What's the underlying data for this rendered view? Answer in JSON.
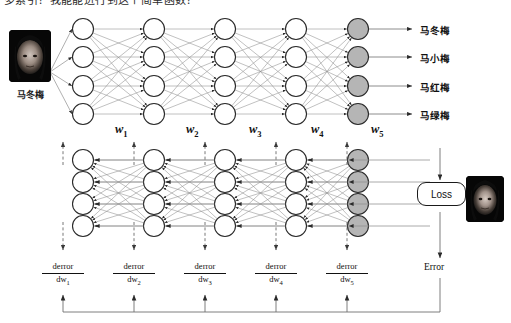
{
  "header": {
    "clipped_text": "多索引？我能能进行到这个简单函数？"
  },
  "input": {
    "caption": "马冬梅",
    "alt": "input-face-photo"
  },
  "target": {
    "alt": "target-face-photo"
  },
  "outputs": [
    {
      "label": "马冬梅"
    },
    {
      "label": "马小梅"
    },
    {
      "label": "马红梅"
    },
    {
      "label": "马绿梅"
    }
  ],
  "weights": [
    {
      "symbol": "w",
      "sub": "1"
    },
    {
      "symbol": "w",
      "sub": "2"
    },
    {
      "symbol": "w",
      "sub": "3"
    },
    {
      "symbol": "w",
      "sub": "4"
    },
    {
      "symbol": "w",
      "sub": "5"
    }
  ],
  "gradients": [
    {
      "numerator": "derror",
      "denominator": "dw",
      "sub": "1"
    },
    {
      "numerator": "derror",
      "denominator": "dw",
      "sub": "2"
    },
    {
      "numerator": "derror",
      "denominator": "dw",
      "sub": "3"
    },
    {
      "numerator": "derror",
      "denominator": "dw",
      "sub": "4"
    },
    {
      "numerator": "derror",
      "denominator": "dw",
      "sub": "5"
    }
  ],
  "loss": {
    "label": "Loss"
  },
  "error": {
    "label": "Error"
  },
  "network": {
    "forward": {
      "layers": 5,
      "nodes_per_layer": 4,
      "output_layer_index": 4
    },
    "backward": {
      "layers": 5,
      "nodes_per_layer": 4,
      "output_layer_index": 4
    }
  },
  "colors": {
    "node_fill": "#ffffff",
    "node_stroke": "#2a2a2a",
    "output_node_fill": "#b5b5b5",
    "edge": "#8e8e8e",
    "arrow": "#2a2a2a",
    "dashed": "#555555",
    "text": "#111111",
    "background": "#ffffff"
  }
}
